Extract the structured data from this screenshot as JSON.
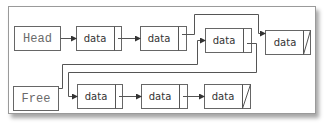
{
  "diagram": {
    "type": "linked-list",
    "labels": {
      "head": "Head",
      "free": "Free"
    },
    "node_label": "data",
    "used_list": {
      "name": "Head",
      "order": [
        "node-a",
        "node-b",
        "node-c",
        "node-d"
      ]
    },
    "free_list": {
      "name": "Free",
      "order": [
        "node-c",
        "free-1",
        "free-2",
        "free-3"
      ]
    },
    "nodes": [
      {
        "id": "node-a",
        "label": "data",
        "null_pointer": false
      },
      {
        "id": "node-b",
        "label": "data",
        "null_pointer": false
      },
      {
        "id": "node-c",
        "label": "data",
        "null_pointer": false
      },
      {
        "id": "node-d",
        "label": "data",
        "null_pointer": true
      },
      {
        "id": "free-1",
        "label": "data",
        "null_pointer": false
      },
      {
        "id": "free-2",
        "label": "data",
        "null_pointer": false
      },
      {
        "id": "free-3",
        "label": "data",
        "null_pointer": true
      }
    ],
    "colors": {
      "stroke": "#666666",
      "text": "#333333",
      "pointer_label_text": "#6a6a6a"
    }
  }
}
